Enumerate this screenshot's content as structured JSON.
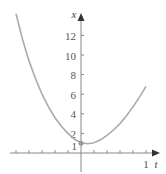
{
  "chart_data": {
    "type": "line",
    "title": "",
    "xlabel": "t",
    "ylabel": "x",
    "xlim": [
      -1.05,
      1.1
    ],
    "ylim": [
      -1.6,
      15
    ],
    "grid": false,
    "legend": null,
    "x_tick_labels": [
      "1"
    ],
    "x_ticks": [
      -1.0,
      -0.8,
      -0.6,
      -0.4,
      -0.2,
      0.2,
      0.4,
      0.6,
      0.8,
      1.0
    ],
    "y_tick_labels": [
      "1",
      "2",
      "4",
      "6",
      "8",
      "10",
      "12"
    ],
    "y_ticks": [
      2,
      4,
      6,
      8,
      10,
      12
    ],
    "series": [
      {
        "name": "x(t)",
        "color": "#aaaaaa",
        "x": [
          -1.0,
          -0.9,
          -0.8,
          -0.7,
          -0.6,
          -0.5,
          -0.4,
          -0.3,
          -0.2,
          -0.1,
          0.0,
          0.1,
          0.2,
          0.3,
          0.4,
          0.5,
          0.6,
          0.7,
          0.8,
          0.9,
          1.0
        ],
        "y": [
          14.2,
          11.6,
          9.4,
          7.6,
          6.0,
          4.7,
          3.6,
          2.7,
          2.0,
          1.4,
          1.05,
          0.95,
          1.05,
          1.35,
          1.8,
          2.35,
          3.0,
          3.8,
          4.7,
          5.7,
          6.8
        ]
      }
    ],
    "annotations": [
      {
        "type": "point",
        "x": 0,
        "y": 1,
        "color": "#999999"
      }
    ]
  },
  "axes": {
    "x_axis_label": "t",
    "y_axis_label": "x",
    "x_end_label": "1",
    "y_labels": [
      "12",
      "10",
      "8",
      "6",
      "4",
      "2",
      "1"
    ]
  }
}
